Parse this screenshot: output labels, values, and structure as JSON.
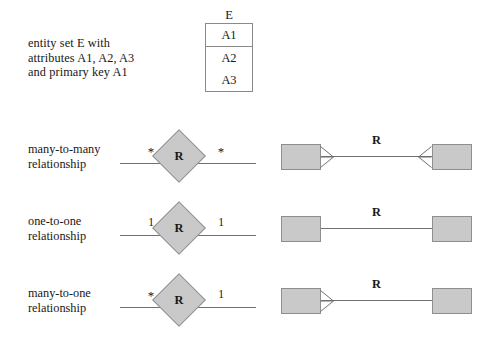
{
  "figure": {
    "background_color": "#ffffff",
    "shape_fill_color": "#c9c9c9",
    "shape_stroke_color": "#8e8e8e",
    "line_color": "#6f6f6f",
    "text_color": "#181818"
  },
  "entity": {
    "caption": "entity set E with\nattributes A1, A2, A3\nand primary key A1",
    "name": "E",
    "key_attribute": "A1",
    "attributes": [
      "A2",
      "A3"
    ]
  },
  "rows": [
    {
      "caption": "many-to-many\nrelationship",
      "relationship_label": "R",
      "left_cardinality": "*",
      "right_cardinality": "*",
      "uml_relationship_label": "R",
      "left_crowfoot": true,
      "right_crowfoot": true
    },
    {
      "caption": "one-to-one\nrelationship",
      "relationship_label": "R",
      "left_cardinality": "1",
      "right_cardinality": "1",
      "uml_relationship_label": "R",
      "left_crowfoot": false,
      "right_crowfoot": false
    },
    {
      "caption": "many-to-one\nrelationship",
      "relationship_label": "R",
      "left_cardinality": "*",
      "right_cardinality": "1",
      "uml_relationship_label": "R",
      "left_crowfoot": true,
      "right_crowfoot": false
    }
  ]
}
